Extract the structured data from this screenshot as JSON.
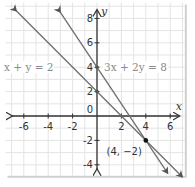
{
  "chart_data": {
    "type": "line",
    "title": "",
    "xlabel": "x",
    "ylabel": "y",
    "xlim": [
      -7.5,
      7.2
    ],
    "ylim": [
      -4.9,
      9.3
    ],
    "grid": true,
    "grid_step": 1,
    "x_ticks": [
      -6,
      -4,
      -2,
      2,
      4,
      6
    ],
    "x_tick_labels": [
      "-6",
      "-4",
      "-2",
      "2",
      "4",
      "6"
    ],
    "y_ticks": [
      8,
      6,
      4,
      2,
      -2,
      -4
    ],
    "y_tick_labels": [
      "8",
      "6",
      "4",
      "2",
      "-2",
      "-4"
    ],
    "origin_label": "0",
    "series": [
      {
        "name": "x + y = 2",
        "equation": {
          "a": 1,
          "b": 1,
          "c": 2
        },
        "x_range": [
          -6.6,
          7.0
        ],
        "label": "x + y = 2",
        "color": "#6e6e6e"
      },
      {
        "name": "3x + 2y = 8",
        "equation": {
          "a": 3,
          "b": 2,
          "c": 8
        },
        "x_range": [
          -3.0,
          5.8
        ],
        "label": "3x + 2y = 8",
        "color": "#6e6e6e"
      }
    ],
    "points": [
      {
        "x": 4,
        "y": -2,
        "label": "(4, −2)"
      }
    ],
    "y_intercept_marks": [
      {
        "x": 0,
        "y": 2
      },
      {
        "x": 0,
        "y": 4
      }
    ],
    "colors": {
      "grid": "#e4e4e4",
      "axis": "#333333",
      "lines": "#6e6e6e",
      "equation_text": "#8a8a8a",
      "frame_shadow": "#d0d0d0"
    }
  }
}
